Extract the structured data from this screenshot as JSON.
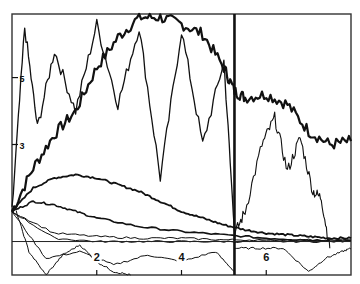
{
  "chart_data": {
    "type": "line",
    "title": "",
    "xlabel": "",
    "ylabel": "",
    "xlim": [
      0,
      8
    ],
    "ylim": [
      -0.9,
      6.9
    ],
    "grid": false,
    "legend": null,
    "x_ticks": [
      2,
      4,
      6
    ],
    "x_tick_labels": [
      "2",
      "4",
      "6"
    ],
    "y_ticks": [
      3,
      5
    ],
    "y_tick_labels": [
      "3",
      "5"
    ],
    "reference_lines": {
      "vertical": [
        {
          "x": 5.25,
          "style": "thick"
        }
      ],
      "horizontal": [
        {
          "y": 0.1,
          "style": "thin"
        }
      ]
    },
    "annotations": [],
    "series": [
      {
        "name": "trajectory-1 (thick, rising then plateau)",
        "width": 2.2,
        "x": [
          0,
          0.5,
          1,
          1.5,
          2,
          2.5,
          3,
          3.5,
          4,
          4.5,
          5,
          5.25,
          5.5,
          6,
          6.5,
          7,
          7.5,
          8
        ],
        "y": [
          1.0,
          2.3,
          3.3,
          4.0,
          5.3,
          6.2,
          6.8,
          6.8,
          6.6,
          6.3,
          5.3,
          4.6,
          4.4,
          4.5,
          4.2,
          3.4,
          3.0,
          3.1
        ]
      },
      {
        "name": "trajectory-2 (noisy high)",
        "width": 1.3,
        "x": [
          0,
          0.3,
          0.6,
          1,
          1.5,
          2,
          2.5,
          3,
          3.5,
          4,
          4.5,
          5,
          5.25
        ],
        "y": [
          1.0,
          6.5,
          3.5,
          5.8,
          4.0,
          6.6,
          4.2,
          6.5,
          2.0,
          6.4,
          3.0,
          5.5,
          0.4
        ]
      },
      {
        "name": "trajectory-3 (mid hump)",
        "width": 1.8,
        "x": [
          0,
          0.5,
          1,
          1.5,
          2,
          2.5,
          3,
          3.5,
          4,
          4.5,
          5,
          5.5,
          6,
          6.5,
          7,
          7.5,
          8
        ],
        "y": [
          1.0,
          1.7,
          2.0,
          2.1,
          2.0,
          1.8,
          1.6,
          1.3,
          1.0,
          0.8,
          0.6,
          0.45,
          0.35,
          0.3,
          0.25,
          0.2,
          0.2
        ]
      },
      {
        "name": "trajectory-4 (decay)",
        "width": 1.6,
        "x": [
          0,
          0.5,
          1,
          1.5,
          2,
          3,
          4,
          5,
          6,
          7,
          8
        ],
        "y": [
          1.0,
          1.3,
          1.2,
          1.0,
          0.8,
          0.55,
          0.4,
          0.3,
          0.2,
          0.15,
          0.12
        ]
      },
      {
        "name": "trajectory-5 (right side peak)",
        "width": 1.1,
        "x": [
          5.25,
          5.5,
          5.9,
          6.2,
          6.5,
          6.8,
          7.1,
          7.3,
          7.5
        ],
        "y": [
          0.3,
          1.0,
          3.0,
          3.8,
          2.2,
          3.2,
          1.6,
          1.4,
          -0.1
        ]
      },
      {
        "name": "trajectory-6 (low wiggle)",
        "width": 1.0,
        "x": [
          0,
          0.8,
          1.6,
          2.4,
          3.2,
          4.0,
          4.8,
          5.25
        ],
        "y": [
          1.0,
          -0.4,
          -0.2,
          -0.6,
          -0.3,
          -0.5,
          -0.2,
          -0.8
        ]
      },
      {
        "name": "trajectory-7 (bottom-right wiggle)",
        "width": 1.0,
        "x": [
          5.25,
          5.8,
          6.4,
          7.0,
          7.4,
          7.8,
          8
        ],
        "y": [
          -0.1,
          -0.1,
          -0.1,
          -0.8,
          -0.4,
          -0.2,
          -0.1
        ]
      },
      {
        "name": "trajectory-8 (near baseline)",
        "width": 1.0,
        "x": [
          0,
          1,
          2,
          3,
          4,
          5,
          6,
          7,
          8
        ],
        "y": [
          1.0,
          0.2,
          0.1,
          0.1,
          0.1,
          0.1,
          0.1,
          0.1,
          0.1
        ]
      },
      {
        "name": "trajectory-9 (near baseline)",
        "width": 1.0,
        "x": [
          0,
          1,
          2,
          3,
          4,
          5,
          6,
          7,
          8
        ],
        "y": [
          1.0,
          0.35,
          0.25,
          0.2,
          0.2,
          0.15,
          0.15,
          0.15,
          0.15
        ]
      },
      {
        "name": "trajectory-10 (bottom-left loop)",
        "width": 1.0,
        "x": [
          0.1,
          0.4,
          0.8,
          1.2,
          1.6,
          2.0,
          2.4,
          2.8
        ],
        "y": [
          1.0,
          -0.2,
          -0.9,
          -0.3,
          0.0,
          -0.5,
          -0.8,
          -0.9
        ]
      }
    ]
  }
}
